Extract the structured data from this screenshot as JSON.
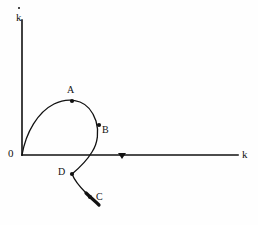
{
  "figure": {
    "title": "",
    "background_color": "#fefefe",
    "ink_color": "#111111",
    "width": 258,
    "height": 225
  },
  "axes": {
    "vertical": {
      "label": "k",
      "label_has_overdot": true,
      "name": "k-dot-axis",
      "origin_px": [
        22,
        155
      ],
      "end_px": [
        22,
        20
      ]
    },
    "horizontal": {
      "label": "k",
      "name": "k-axis",
      "origin_px": [
        22,
        155
      ],
      "end_px": [
        238,
        155
      ]
    },
    "origin_label": "0",
    "direction_marker": {
      "name": "x-axis-direction-arrow",
      "position_px": [
        122,
        155
      ],
      "shape": "small-downward-triangle"
    }
  },
  "points": [
    {
      "id": "A",
      "label": "A",
      "x_px": 72,
      "y_px": 101,
      "description": "peak region of upper trajectory"
    },
    {
      "id": "B",
      "label": "B",
      "x_px": 99,
      "y_px": 125,
      "description": "descending branch above axis"
    },
    {
      "id": "C",
      "label": "C",
      "x_px": 94,
      "y_px": 200,
      "description": "trajectory endpoint below axis"
    },
    {
      "id": "D",
      "label": "D",
      "x_px": 72,
      "y_px": 174,
      "description": "turning point below axis"
    }
  ],
  "trajectory": {
    "name": "phase-trajectory",
    "stroke_width": 1.3,
    "description": "Curve starting at the origin, rising to a hump through A, bending down past B, crossing the horizontal axis, reaching a kink at D, then sloping down-right to a thickened arrow end at C.",
    "path": "M 22 155 C 26 132, 38 112, 54 104 C 64 99, 72 99, 80 102 C 88 105, 93 112, 96 121 C 99 131, 98 143, 92 152 C 86 162, 78 169, 72 174 C 74 179, 79 186, 86 193 C 90 197, 95 201, 99 205",
    "arrow_end": {
      "name": "trajectory-arrowhead",
      "at_px": [
        99,
        205
      ],
      "thickened_from_px": [
        86,
        193
      ]
    }
  },
  "markers": {
    "dot_radius_px": 2.0,
    "dot_color": "#111111"
  }
}
